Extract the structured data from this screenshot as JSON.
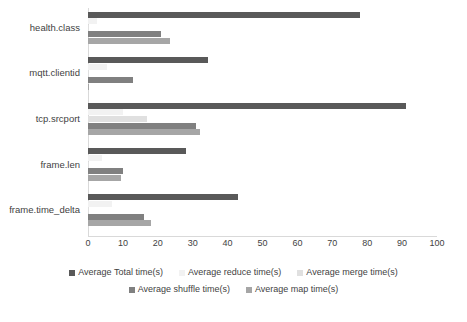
{
  "chart_data": {
    "type": "bar",
    "orientation": "horizontal",
    "title": "",
    "xlabel": "",
    "ylabel": "",
    "xlim": [
      0,
      100
    ],
    "xticks": [
      "0",
      "10",
      "20",
      "30",
      "40",
      "50",
      "60",
      "70",
      "80",
      "90",
      "100"
    ],
    "grid": false,
    "legend_position": "bottom",
    "categories": [
      "health.class",
      "mqtt.clientid",
      "tcp.srcport",
      "frame.len",
      "frame.time_delta"
    ],
    "series": [
      {
        "name": "Average Total time(s)",
        "color": "#595959",
        "values": [
          78,
          34.5,
          91,
          28,
          43
        ]
      },
      {
        "name": "Average reduce time(s)",
        "color": "#f2f2f2",
        "values": [
          2.5,
          5.5,
          10,
          4,
          7
        ]
      },
      {
        "name": "Average merge time(s)",
        "color": "#e0e0e0",
        "values": [
          0.4,
          0.4,
          17,
          0.4,
          0.4
        ]
      },
      {
        "name": "Average shuffle time(s)",
        "color": "#808080",
        "values": [
          21,
          13,
          31,
          10,
          16
        ]
      },
      {
        "name": "Average map time(s)",
        "color": "#a6a6a6",
        "values": [
          23.5,
          0.3,
          32,
          9.5,
          18
        ]
      }
    ]
  }
}
